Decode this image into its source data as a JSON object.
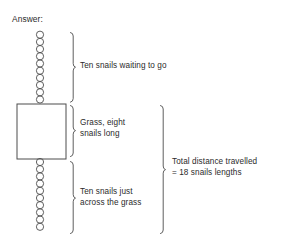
{
  "diagram": {
    "title_label": "Answer:",
    "labels": {
      "top_segment": "Ten snails waiting to go",
      "middle_segment": "Grass, eight\nsnails long",
      "bottom_segment": "Ten snails just\nacross the grass",
      "total_segment": "Total distance travelled\n= 18 snails lengths"
    },
    "snail_chain": {
      "top_count": 10,
      "bottom_count": 10,
      "circle_diameter_px": 7.4,
      "center_x_px": 40,
      "top_chain_start_y_px": 31,
      "bottom_chain_start_y_px": 158,
      "stroke_color": "#4d4d4d"
    },
    "grass_box": {
      "x_px": 17,
      "y_px": 104,
      "width_px": 49,
      "height_px": 55,
      "stroke_color": "#4d4d4d",
      "fill_color": "#ffffff",
      "snails_long": 8
    },
    "brackets": [
      {
        "name": "top",
        "x_px": 73,
        "y_top_px": 32,
        "y_bottom_px": 102
      },
      {
        "name": "middle",
        "x_px": 73,
        "y_top_px": 105,
        "y_bottom_px": 157
      },
      {
        "name": "bottom",
        "x_px": 73,
        "y_top_px": 161,
        "y_bottom_px": 234
      },
      {
        "name": "total",
        "x_px": 163,
        "y_top_px": 105,
        "y_bottom_px": 234
      }
    ],
    "colors": {
      "background": "#ffffff",
      "stroke": "#4d4d4d",
      "text": "#2b2b2b"
    }
  }
}
